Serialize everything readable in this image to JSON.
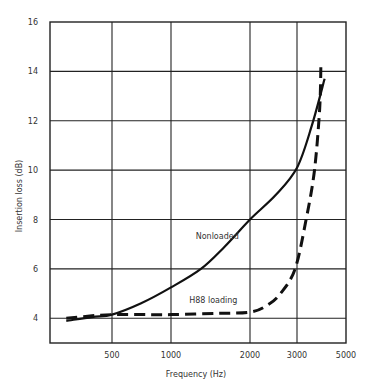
{
  "chart_data": {
    "type": "line",
    "title": "",
    "xlabel": "Frequency (Hz)",
    "ylabel": "Insertion loss (dB)",
    "x_ticks": [
      500,
      1000,
      2000,
      3000,
      5000
    ],
    "x_tick_labels": [
      "500",
      "1000",
      "2000",
      "3000",
      "5000"
    ],
    "y_ticks": [
      4,
      6,
      8,
      10,
      12,
      14,
      16
    ],
    "y_tick_labels": [
      "4",
      "6",
      "8",
      "10",
      "12",
      "14",
      "16"
    ],
    "ylim": [
      3,
      16
    ],
    "xlim": [
      250,
      5000
    ],
    "grid": true,
    "legend": "none (inline annotations)",
    "series": [
      {
        "name": "Nonloaded",
        "style": "solid",
        "x": [
          300,
          400,
          500,
          700,
          1000,
          1300,
          1600,
          2000,
          2500,
          3000,
          3500,
          4000
        ],
        "y": [
          3.9,
          4.05,
          4.15,
          4.6,
          5.25,
          6.0,
          6.9,
          8.0,
          9.0,
          10.1,
          11.8,
          13.7
        ]
      },
      {
        "name": "H88 loading",
        "style": "dashed",
        "x": [
          300,
          400,
          500,
          700,
          1000,
          1500,
          2000,
          2300,
          2600,
          2950,
          3300,
          3600,
          3800,
          3850
        ],
        "y": [
          4.0,
          4.1,
          4.15,
          4.15,
          4.15,
          4.2,
          4.25,
          4.5,
          5.0,
          6.0,
          8.0,
          10.0,
          12.5,
          14.3
        ]
      }
    ],
    "annotations": [
      {
        "text": "Nonloaded",
        "x": 1500,
        "y": 7.2
      },
      {
        "text": "H88 loading",
        "x": 1450,
        "y": 4.6
      }
    ]
  }
}
